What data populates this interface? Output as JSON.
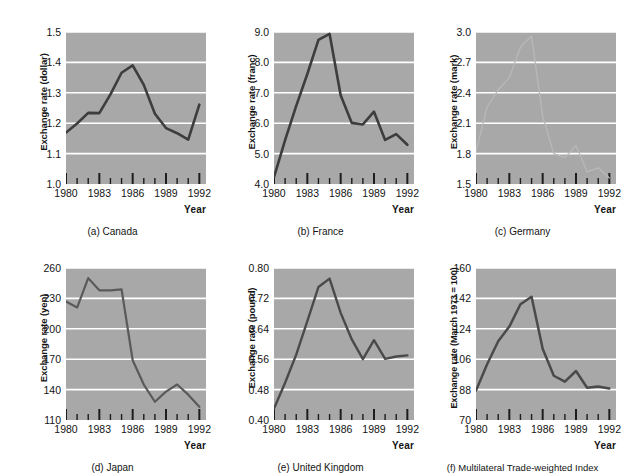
{
  "figure": {
    "xlabel": "Year",
    "xticks_major": [
      1980,
      1983,
      1986,
      1989,
      1992
    ],
    "xlim": [
      1980,
      1992.6
    ]
  },
  "chart_data": [
    {
      "type": "line",
      "id": "canada",
      "caption": "(a) Canada",
      "title": "",
      "xlabel": "Year",
      "ylabel": "Exchange rate (dollar)",
      "xlim": [
        1980,
        1992.6
      ],
      "ylim": [
        1.0,
        1.5
      ],
      "yticks": [
        1.0,
        1.1,
        1.2,
        1.3,
        1.4,
        1.5
      ],
      "ytick_labels": [
        "1.0",
        "1.1",
        "1.2",
        "1.3",
        "1.4",
        "1.5"
      ],
      "xticks": [
        1980,
        1983,
        1986,
        1989,
        1992
      ],
      "xtick_labels": [
        "1980",
        "1983",
        "1986",
        "1989",
        "1992"
      ],
      "grid": "horizontal",
      "line_color": "#3d3d3d",
      "line_width": 2.6,
      "x": [
        1980,
        1981,
        1982,
        1983,
        1984,
        1985,
        1986,
        1987,
        1988,
        1989,
        1990,
        1991,
        1992
      ],
      "values": [
        1.169,
        1.199,
        1.234,
        1.233,
        1.295,
        1.366,
        1.39,
        1.326,
        1.231,
        1.184,
        1.167,
        1.146,
        1.261
      ]
    },
    {
      "type": "line",
      "id": "france",
      "caption": "(b) France",
      "title": "",
      "xlabel": "Year",
      "ylabel": "Exchange rate (franc)",
      "xlim": [
        1980,
        1992.6
      ],
      "ylim": [
        4.0,
        9.0
      ],
      "yticks": [
        4.0,
        5.0,
        6.0,
        7.0,
        8.0,
        9.0
      ],
      "ytick_labels": [
        "4.0",
        "5.0",
        "6.0",
        "7.0",
        "8.0",
        "9.0"
      ],
      "xticks": [
        1980,
        1983,
        1986,
        1989,
        1992
      ],
      "xtick_labels": [
        "1980",
        "1983",
        "1986",
        "1989",
        "1992"
      ],
      "grid": "horizontal",
      "line_color": "#3d3d3d",
      "line_width": 2.6,
      "x": [
        1980,
        1981,
        1982,
        1983,
        1984,
        1985,
        1986,
        1987,
        1988,
        1989,
        1990,
        1991,
        1992
      ],
      "values": [
        4.23,
        5.44,
        6.57,
        7.62,
        8.74,
        8.94,
        6.92,
        6.01,
        5.96,
        6.38,
        5.45,
        5.64,
        5.29
      ]
    },
    {
      "type": "line",
      "id": "germany",
      "caption": "(c) Germany",
      "title": "",
      "xlabel": "Year",
      "ylabel": "Exchange rate (mark)",
      "xlim": [
        1980,
        1992.6
      ],
      "ylim": [
        1.5,
        3.0
      ],
      "yticks": [
        1.5,
        1.8,
        2.1,
        2.4,
        2.7,
        3.0
      ],
      "ytick_labels": [
        "1.5",
        "1.8",
        "2.1",
        "2.4",
        "2.7",
        "3.0"
      ],
      "xticks": [
        1980,
        1983,
        1986,
        1989,
        1992
      ],
      "xtick_labels": [
        "1980",
        "1983",
        "1986",
        "1989",
        "1992"
      ],
      "grid": "horizontal",
      "line_color": "#b9b9b9",
      "line_width": 1.3,
      "x": [
        1980,
        1981,
        1982,
        1983,
        1984,
        1985,
        1986,
        1987,
        1988,
        1989,
        1990,
        1991,
        1992
      ],
      "values": [
        1.82,
        2.26,
        2.43,
        2.55,
        2.85,
        2.96,
        2.17,
        1.8,
        1.76,
        1.88,
        1.62,
        1.66,
        1.56
      ]
    },
    {
      "type": "line",
      "id": "japan",
      "caption": "(d) Japan",
      "title": "",
      "xlabel": "Year",
      "ylabel": "Exchange rate (yen)",
      "xlim": [
        1980,
        1992.6
      ],
      "ylim": [
        110,
        260
      ],
      "yticks": [
        110,
        140,
        170,
        200,
        230,
        260
      ],
      "ytick_labels": [
        "110",
        "140",
        "170",
        "200",
        "230",
        "260"
      ],
      "xticks": [
        1980,
        1983,
        1986,
        1989,
        1992
      ],
      "xtick_labels": [
        "1980",
        "1983",
        "1986",
        "1989",
        "1992"
      ],
      "grid": "horizontal",
      "line_color": "#5a5a5a",
      "line_width": 2.2,
      "x": [
        1980,
        1981,
        1982,
        1983,
        1984,
        1985,
        1986,
        1987,
        1988,
        1989,
        1990,
        1991,
        1992
      ],
      "values": [
        227,
        221,
        250,
        238,
        238,
        239,
        169,
        145,
        128,
        138,
        145,
        135,
        123
      ]
    },
    {
      "type": "line",
      "id": "united-kingdom",
      "caption": "(e) United Kingdom",
      "title": "",
      "xlabel": "Year",
      "ylabel": "Exchange rate (pound)",
      "xlim": [
        1980,
        1992.6
      ],
      "ylim": [
        0.4,
        0.8
      ],
      "yticks": [
        0.4,
        0.48,
        0.56,
        0.64,
        0.72,
        0.8
      ],
      "ytick_labels": [
        "0.40",
        "0.48",
        "0.56",
        "0.64",
        "0.72",
        "0.80"
      ],
      "xticks": [
        1980,
        1983,
        1986,
        1989,
        1992
      ],
      "xtick_labels": [
        "1980",
        "1983",
        "1986",
        "1989",
        "1992"
      ],
      "grid": "horizontal",
      "line_color": "#4a4a4a",
      "line_width": 2.4,
      "x": [
        1980,
        1981,
        1982,
        1983,
        1984,
        1985,
        1986,
        1987,
        1988,
        1989,
        1990,
        1991,
        1992
      ],
      "values": [
        0.43,
        0.498,
        0.572,
        0.66,
        0.75,
        0.772,
        0.682,
        0.612,
        0.56,
        0.61,
        0.561,
        0.567,
        0.57
      ]
    },
    {
      "type": "line",
      "id": "multilateral-trade-weighted-index",
      "caption": "(f) Multilateral Trade-weighted Index",
      "title": "",
      "xlabel": "Year",
      "ylabel": "Exchange rate (March 1973 = 100)",
      "xlim": [
        1980,
        1992.6
      ],
      "ylim": [
        70,
        160
      ],
      "yticks": [
        70,
        88,
        106,
        124,
        142,
        160
      ],
      "ytick_labels": [
        "70",
        "88",
        "106",
        "124",
        "142",
        "160"
      ],
      "xticks": [
        1980,
        1983,
        1986,
        1989,
        1992
      ],
      "xtick_labels": [
        "1980",
        "1983",
        "1986",
        "1989",
        "1992"
      ],
      "grid": "horizontal",
      "line_color": "#4a4a4a",
      "line_width": 2.5,
      "x": [
        1980,
        1981,
        1982,
        1983,
        1984,
        1985,
        1986,
        1987,
        1988,
        1989,
        1990,
        1991,
        1992
      ],
      "values": [
        87.4,
        103.0,
        116.6,
        125.3,
        138.5,
        143.0,
        112.2,
        96.2,
        92.7,
        99.0,
        89.1,
        89.8,
        88.6
      ]
    }
  ]
}
